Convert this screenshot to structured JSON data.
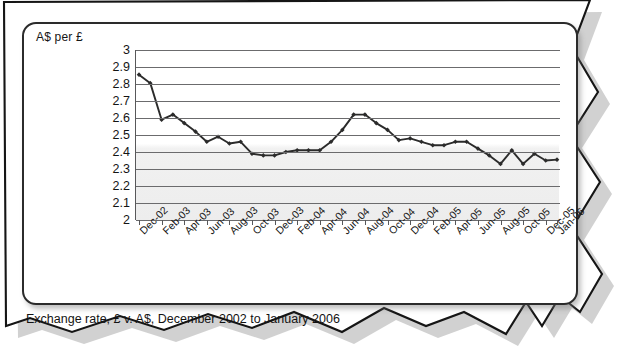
{
  "card": {
    "y_axis_title": "A$ per £"
  },
  "caption": {
    "text": "Exchange rate, £ v. A$, December 2002 to January 2006"
  },
  "chart_data": {
    "type": "line",
    "title": "",
    "subtitle": "",
    "xlabel": "",
    "ylabel": "A$ per £",
    "ylim": [
      2,
      3
    ],
    "ytick_step": 0.1,
    "yticks": [
      2,
      2.1,
      2.2,
      2.3,
      2.4,
      2.5,
      2.6,
      2.7,
      2.8,
      2.9,
      3
    ],
    "ytick_labels": [
      "2",
      "2.1",
      "2.2",
      "2.3",
      "2.4",
      "2.5",
      "2.6",
      "2.7",
      "2.8",
      "2.9",
      "3"
    ],
    "grid": true,
    "grid_axis": "y",
    "legend": false,
    "legend_position": "none",
    "marker": "diamond",
    "line_color": "#2b2b2b",
    "xtick_labels": [
      "Dec-02",
      "Feb-03",
      "Apr-03",
      "Jun-03",
      "Aug-03",
      "Oct-03",
      "Dec-03",
      "Feb-04",
      "Apr-04",
      "Jun-04",
      "Aug-04",
      "Oct-04",
      "Dec-04",
      "Feb-05",
      "Apr-05",
      "Jun-05",
      "Aug-05",
      "Oct-05",
      "Dec-05",
      "Jan-06"
    ],
    "xtick_step_months": 2,
    "x": [
      "Dec-02",
      "Jan-03",
      "Feb-03",
      "Mar-03",
      "Apr-03",
      "May-03",
      "Jun-03",
      "Jul-03",
      "Aug-03",
      "Sep-03",
      "Oct-03",
      "Nov-03",
      "Dec-03",
      "Jan-04",
      "Feb-04",
      "Mar-04",
      "Apr-04",
      "May-04",
      "Jun-04",
      "Jul-04",
      "Aug-04",
      "Sep-04",
      "Oct-04",
      "Nov-04",
      "Dec-04",
      "Jan-05",
      "Feb-05",
      "Mar-05",
      "Apr-05",
      "May-05",
      "Jun-05",
      "Jul-05",
      "Aug-05",
      "Sep-05",
      "Oct-05",
      "Nov-05",
      "Dec-05",
      "Jan-06"
    ],
    "values": [
      2.855,
      2.805,
      2.59,
      2.62,
      2.57,
      2.52,
      2.46,
      2.49,
      2.45,
      2.46,
      2.39,
      2.38,
      2.38,
      2.4,
      2.41,
      2.41,
      2.41,
      2.46,
      2.53,
      2.62,
      2.62,
      2.57,
      2.53,
      2.47,
      2.48,
      2.46,
      2.44,
      2.44,
      2.46,
      2.46,
      2.42,
      2.38,
      2.33,
      2.41,
      2.33,
      2.39,
      2.35,
      2.355
    ]
  }
}
